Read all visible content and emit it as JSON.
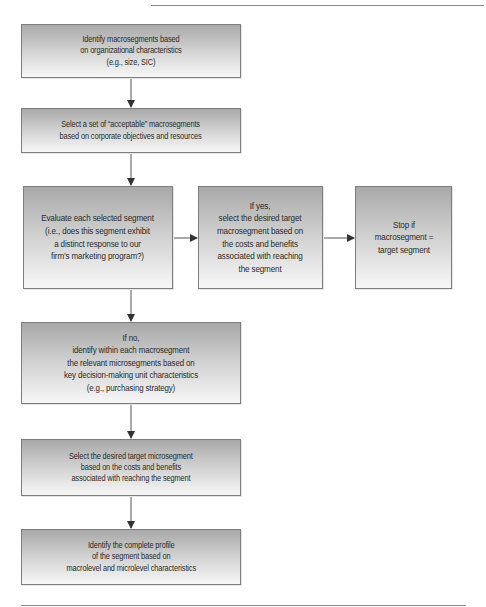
{
  "diagram": {
    "type": "flowchart",
    "title": "",
    "nodes": [
      {
        "id": "identify-macrosegments",
        "label": "Identify macrosegments based\non organizational characteristics\n(e.g., size, SIC)"
      },
      {
        "id": "select-acceptable",
        "label": "Select a set of “acceptable” macrosegments\nbased on corporate objectives and resources"
      },
      {
        "id": "evaluate-segment",
        "label": "Evaluate each selected segment\n(i.e., does this segment exhibit\na distinct response to our\nfirm’s marketing program?)"
      },
      {
        "id": "if-yes",
        "label": "If yes,\nselect the desired target\nmacrosegment based on\nthe costs and benefits\nassociated with reaching\nthe segment"
      },
      {
        "id": "stop",
        "label": "Stop if\nmacrosegment =\ntarget segment"
      },
      {
        "id": "if-no",
        "label": "If no,\nidentify within each macrosegment\nthe relevant microsegments based on\nkey decision-making unit characteristics\n(e.g., purchasing strategy)"
      },
      {
        "id": "select-microsegment",
        "label": "Select the desired target microsegment\nbased on the costs and benefits\nassociated with reaching the segment"
      },
      {
        "id": "complete-profile",
        "label": "Identify the complete profile\nof the segment based on\nmacrolevel and microlevel characteristics"
      }
    ],
    "edges": [
      {
        "from": "identify-macrosegments",
        "to": "select-acceptable"
      },
      {
        "from": "select-acceptable",
        "to": "evaluate-segment"
      },
      {
        "from": "evaluate-segment",
        "to": "if-yes"
      },
      {
        "from": "if-yes",
        "to": "stop"
      },
      {
        "from": "evaluate-segment",
        "to": "if-no"
      },
      {
        "from": "if-no",
        "to": "select-microsegment"
      },
      {
        "from": "select-microsegment",
        "to": "complete-profile"
      }
    ],
    "colors": {
      "box_top": "#a9a9a9",
      "box_bottom": "#f7f7f7",
      "border": "#7d7d7d",
      "text": "#2a2a2a",
      "arrow": "#333333",
      "rule": "#8a8a8a"
    }
  }
}
